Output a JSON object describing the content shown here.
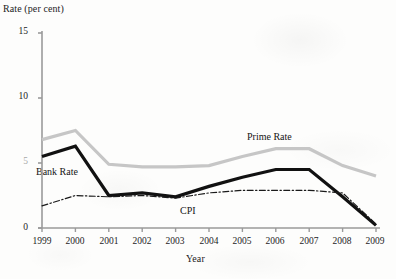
{
  "figure": {
    "width": 396,
    "height": 279,
    "background_color": "#fdfdfc"
  },
  "chart_data": {
    "type": "line",
    "title": "",
    "ylabel": "Rate (per cent)",
    "xlabel": "Year",
    "x": [
      1999,
      2000,
      2001,
      2002,
      2003,
      2004,
      2005,
      2006,
      2007,
      2008,
      2009
    ],
    "xtick_labels": [
      "1999",
      "2000",
      "2001",
      "2002",
      "2003",
      "2004",
      "2005",
      "2006",
      "2007",
      "2008",
      "2009"
    ],
    "ytick_labels": [
      "0",
      "5",
      "10",
      "15"
    ],
    "ytick_values": [
      0,
      5,
      10,
      15
    ],
    "ylim": [
      0,
      15
    ],
    "xlim": [
      1999,
      2009
    ],
    "grid": false,
    "legend_position": "inline-annotations",
    "series": [
      {
        "name": "Prime Rate",
        "color": "#c6c6c6",
        "style": "solid",
        "width": 3.2,
        "values": [
          6.8,
          7.5,
          4.9,
          4.7,
          4.7,
          4.8,
          5.5,
          6.1,
          6.1,
          4.8,
          4.0
        ]
      },
      {
        "name": "Bank Rate",
        "color": "#111111",
        "style": "solid",
        "width": 3.2,
        "values": [
          5.5,
          6.3,
          2.5,
          2.7,
          2.4,
          3.2,
          3.9,
          4.5,
          4.5,
          2.4,
          0.2
        ]
      },
      {
        "name": "CPI",
        "color": "#1a1a1a",
        "style": "dash-dot",
        "width": 1.2,
        "values": [
          1.7,
          2.5,
          2.4,
          2.5,
          2.3,
          2.7,
          2.9,
          2.9,
          2.9,
          2.7,
          0.3
        ]
      }
    ],
    "annotations": [
      {
        "text": "Bank Rate",
        "series": "Bank Rate"
      },
      {
        "text": "Prime Rate",
        "series": "Prime Rate"
      },
      {
        "text": "CPI",
        "series": "CPI"
      }
    ],
    "axis_color": "#9a9a9a"
  }
}
